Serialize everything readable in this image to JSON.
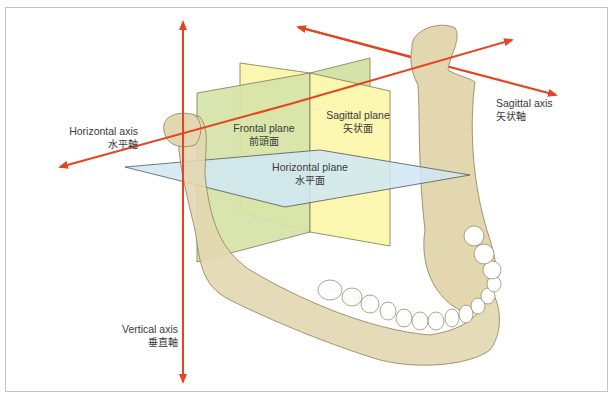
{
  "diagram": {
    "colors": {
      "axis": "#e8431f",
      "frontal_plane": "#d6e3a8",
      "sagittal_plane": "#fbf6b0",
      "horizontal_plane": "#cfe7f5",
      "bone": "#e3d7b0",
      "bone_outline": "#8a7f5c",
      "frame_border": "#c4c4c4",
      "label_text": "#3a3a3a"
    },
    "labels": {
      "horizontal_axis": {
        "en": "Horizontal axis",
        "jp": "水平軸"
      },
      "sagittal_axis": {
        "en": "Sagittal axis",
        "jp": "矢状軸"
      },
      "vertical_axis": {
        "en": "Vertical axis",
        "jp": "垂直軸"
      },
      "frontal_plane": {
        "en": "Frontal plane",
        "jp": "前頭面"
      },
      "sagittal_plane": {
        "en": "Sagittal plane",
        "jp": "矢状面"
      },
      "horizontal_plane": {
        "en": "Horizontal plane",
        "jp": "水平面"
      }
    }
  }
}
